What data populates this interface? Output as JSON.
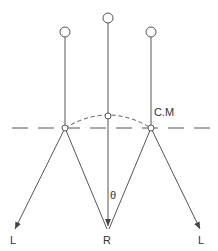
{
  "diagram": {
    "colors": {
      "line": "#555555",
      "text": "#333333",
      "background": "#ffffff"
    },
    "labels": {
      "cm": "C.M",
      "theta": "θ",
      "left_bottom": "L",
      "center_bottom": "R",
      "right_bottom": "L"
    },
    "rods": [
      {
        "name": "left-rod",
        "top": [
          65,
          32
        ],
        "pivot": [
          65,
          128
        ]
      },
      {
        "name": "center-rod",
        "top": [
          108,
          18
        ],
        "pivot": [
          108,
          116
        ]
      },
      {
        "name": "right-rod",
        "top": [
          151,
          32
        ],
        "pivot": [
          151,
          128
        ]
      }
    ],
    "arrows": [
      {
        "name": "arrow-left-L",
        "from": [
          65,
          128
        ],
        "to": [
          15,
          229
        ]
      },
      {
        "name": "arrow-left-R",
        "from": [
          65,
          128
        ],
        "to": [
          107,
          229
        ]
      },
      {
        "name": "arrow-right-R",
        "from": [
          151,
          128
        ],
        "to": [
          107,
          229
        ]
      },
      {
        "name": "arrow-right-L",
        "from": [
          151,
          128
        ],
        "to": [
          200,
          229
        ]
      }
    ]
  }
}
